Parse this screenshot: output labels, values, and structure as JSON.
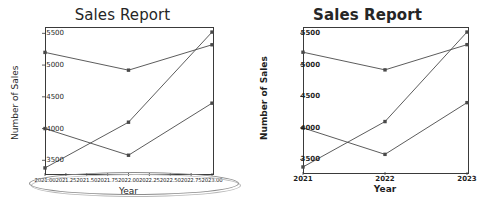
{
  "figure": {
    "width": 490,
    "height": 209,
    "background": "#ffffff",
    "panels": 2
  },
  "colors": {
    "line": "#4a4a4a",
    "axis": "#3a3a3a",
    "text": "#1f1f1f",
    "title": "#262626",
    "annotation": "#8d8d8d"
  },
  "left_panel": {
    "name": "sales-report-crowded-ticks",
    "title": "Sales Report",
    "xlabel": "Year",
    "ylabel": "Number of Sales",
    "yticks": [
      "3500",
      "4000",
      "4500",
      "5000",
      "5500"
    ],
    "xticks": [
      "2021.00",
      "2021.25",
      "2021.50",
      "2021.75",
      "2022.00",
      "2022.25",
      "2022.50",
      "2022.75",
      "2023.00"
    ],
    "annotation": {
      "shape": "ellipse",
      "target": "overlapping-x-tick-labels"
    }
  },
  "right_panel": {
    "name": "sales-report-clean-ticks",
    "title": "Sales Report",
    "xlabel": "Year",
    "ylabel": "Number of Sales",
    "yticks": [
      "3500",
      "4000",
      "4500",
      "5000",
      "5500"
    ],
    "xticks": [
      "2021",
      "2022",
      "2023"
    ]
  },
  "chart_data": [
    {
      "type": "line",
      "title": "Sales Report",
      "xlabel": "Year",
      "ylabel": "Number of Sales",
      "x": [
        2021,
        2022,
        2023
      ],
      "xtick_labels": [
        "2021.00",
        "2021.25",
        "2021.50",
        "2021.75",
        "2022.00",
        "2022.25",
        "2022.50",
        "2022.75",
        "2023.00"
      ],
      "xlim": [
        2021,
        2023
      ],
      "ylim": [
        3300,
        5600
      ],
      "ytick_labels": [
        "3500",
        "4000",
        "4500",
        "5000",
        "5500"
      ],
      "grid": false,
      "legend": "none",
      "marker": "square",
      "series": [
        {
          "name": "Series 1",
          "values": [
            5200,
            4920,
            5320
          ]
        },
        {
          "name": "Series 2",
          "values": [
            4000,
            3580,
            4400
          ]
        },
        {
          "name": "Series 3",
          "values": [
            3380,
            4100,
            5520
          ]
        }
      ],
      "annotation": "gray ellipse circling the overlapping x-axis tick labels"
    },
    {
      "type": "line",
      "title": "Sales Report",
      "xlabel": "Year",
      "ylabel": "Number of Sales",
      "x": [
        2021,
        2022,
        2023
      ],
      "xtick_labels": [
        "2021",
        "2022",
        "2023"
      ],
      "xlim": [
        2021,
        2023
      ],
      "ylim": [
        3300,
        5600
      ],
      "ytick_labels": [
        "3500",
        "4000",
        "4500",
        "5000",
        "5500"
      ],
      "grid": false,
      "legend": "none",
      "marker": "square",
      "series": [
        {
          "name": "Series 1",
          "values": [
            5200,
            4920,
            5320
          ]
        },
        {
          "name": "Series 2",
          "values": [
            4000,
            3580,
            4400
          ]
        },
        {
          "name": "Series 3",
          "values": [
            3380,
            4100,
            5520
          ]
        }
      ]
    }
  ]
}
